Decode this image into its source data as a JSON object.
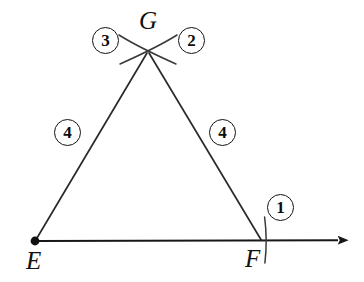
{
  "figure": {
    "kind": "geometry-construction-diagram",
    "background_color": "#ffffff",
    "stroke_color": "#1a1a1a",
    "points": [
      {
        "id": "E",
        "label": "E",
        "x": 35,
        "y": 241,
        "marker": "filled-dot"
      },
      {
        "id": "F",
        "label": "F",
        "x": 262,
        "y": 241,
        "marker": "none"
      },
      {
        "id": "G",
        "label": "G",
        "x": 148,
        "y": 52,
        "marker": "arc-intersection"
      }
    ],
    "point_labels": [
      {
        "text": "E",
        "x": 27,
        "y": 250
      },
      {
        "text": "F",
        "x": 246,
        "y": 248
      },
      {
        "text": "G",
        "x": 139,
        "y": 10
      }
    ],
    "segments": [
      {
        "name": "ray-EF",
        "from": "E",
        "to": "arrow-tip",
        "x1": 35,
        "y1": 241,
        "x2": 341,
        "y2": 240,
        "arrow": true
      },
      {
        "name": "side-EG",
        "from": "E",
        "to": "G",
        "x1": 35,
        "y1": 241,
        "x2": 148,
        "y2": 52,
        "arrow": false
      },
      {
        "name": "side-FG",
        "from": "F",
        "to": "G",
        "x1": 262,
        "y1": 241,
        "x2": 148,
        "y2": 52,
        "arrow": false
      }
    ],
    "arcs": [
      {
        "name": "arc-tick-at-F",
        "orientation": "vertical",
        "x": 266,
        "y_top": 217,
        "y_bottom": 263
      },
      {
        "name": "arc-cross-left-at-G",
        "orientation": "diagonal-down-right"
      },
      {
        "name": "arc-cross-right-at-G",
        "orientation": "diagonal-down-left"
      }
    ],
    "arrow": {
      "tip_x": 348,
      "tip_y": 241,
      "direction": "right"
    },
    "step_labels": [
      {
        "id": "step-1",
        "text": "1",
        "x": 267,
        "y": 194,
        "near": "F"
      },
      {
        "id": "step-2",
        "text": "2",
        "x": 178,
        "y": 27,
        "near": "G"
      },
      {
        "id": "step-3",
        "text": "3",
        "x": 92,
        "y": 27,
        "near": "G"
      },
      {
        "id": "step-4-left",
        "text": "4",
        "x": 54,
        "y": 119,
        "near": "EG"
      },
      {
        "id": "step-4-right",
        "text": "4",
        "x": 209,
        "y": 119,
        "near": "FG"
      }
    ]
  }
}
